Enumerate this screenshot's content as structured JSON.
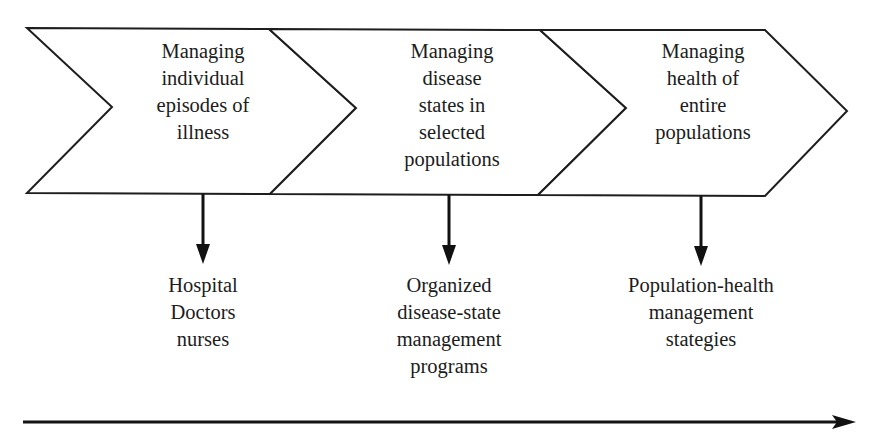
{
  "diagram": {
    "type": "process-chevron-flow",
    "colors": {
      "stroke": "#1e1e1e",
      "fill": "#ffffff",
      "text": "#1c1c1c",
      "arrow": "#111111"
    },
    "stages": [
      {
        "id": "stage-1",
        "title_lines": [
          "Managing",
          "individual",
          "episodes of",
          "illness"
        ],
        "outcome_lines": [
          "Hospital",
          "Doctors",
          "nurses"
        ]
      },
      {
        "id": "stage-2",
        "title_lines": [
          "Managing",
          "disease",
          "states in",
          "selected",
          "populations"
        ],
        "outcome_lines": [
          "Organized",
          "disease-state",
          "management",
          "programs"
        ]
      },
      {
        "id": "stage-3",
        "title_lines": [
          "Managing",
          "health of",
          "entire",
          "populations"
        ],
        "outcome_lines": [
          "Population-health",
          "management",
          "stategies"
        ]
      }
    ],
    "timeline_arrow": {
      "direction": "right"
    }
  }
}
